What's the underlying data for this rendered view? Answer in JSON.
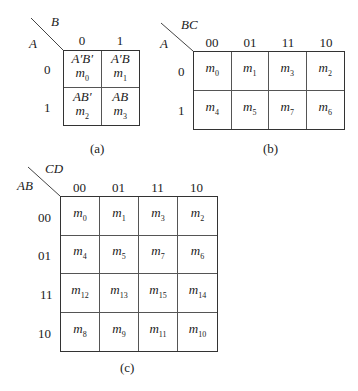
{
  "maps": [
    {
      "id": "a",
      "caption": "(a)",
      "row_var": "A",
      "col_var": "B",
      "col_labels": [
        "0",
        "1"
      ],
      "row_labels": [
        "0",
        "1"
      ],
      "cells": [
        [
          {
            "term": "A′B′",
            "m": "m",
            "idx": "0"
          },
          {
            "term": "A′B",
            "m": "m",
            "idx": "1"
          }
        ],
        [
          {
            "term": "AB′",
            "m": "m",
            "idx": "2"
          },
          {
            "term": "AB",
            "m": "m",
            "idx": "3"
          }
        ]
      ]
    },
    {
      "id": "b",
      "caption": "(b)",
      "row_var": "A",
      "col_var": "BC",
      "col_labels": [
        "00",
        "01",
        "11",
        "10"
      ],
      "row_labels": [
        "0",
        "1"
      ],
      "cells": [
        [
          {
            "m": "m",
            "idx": "0"
          },
          {
            "m": "m",
            "idx": "1"
          },
          {
            "m": "m",
            "idx": "3"
          },
          {
            "m": "m",
            "idx": "2"
          }
        ],
        [
          {
            "m": "m",
            "idx": "4"
          },
          {
            "m": "m",
            "idx": "5"
          },
          {
            "m": "m",
            "idx": "7"
          },
          {
            "m": "m",
            "idx": "6"
          }
        ]
      ]
    },
    {
      "id": "c",
      "caption": "(c)",
      "row_var": "AB",
      "col_var": "CD",
      "col_labels": [
        "00",
        "01",
        "11",
        "10"
      ],
      "row_labels": [
        "00",
        "01",
        "11",
        "10"
      ],
      "cells": [
        [
          {
            "m": "m",
            "idx": "0"
          },
          {
            "m": "m",
            "idx": "1"
          },
          {
            "m": "m",
            "idx": "3"
          },
          {
            "m": "m",
            "idx": "2"
          }
        ],
        [
          {
            "m": "m",
            "idx": "4"
          },
          {
            "m": "m",
            "idx": "5"
          },
          {
            "m": "m",
            "idx": "7"
          },
          {
            "m": "m",
            "idx": "6"
          }
        ],
        [
          {
            "m": "m",
            "idx": "12"
          },
          {
            "m": "m",
            "idx": "13"
          },
          {
            "m": "m",
            "idx": "15"
          },
          {
            "m": "m",
            "idx": "14"
          }
        ],
        [
          {
            "m": "m",
            "idx": "8"
          },
          {
            "m": "m",
            "idx": "9"
          },
          {
            "m": "m",
            "idx": "11"
          },
          {
            "m": "m",
            "idx": "10"
          }
        ]
      ]
    }
  ]
}
